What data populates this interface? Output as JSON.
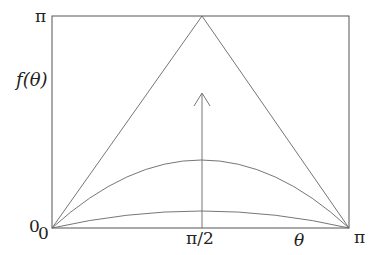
{
  "figure": {
    "y_label": "f(θ)",
    "x_label": "θ",
    "y_ticks": {
      "top": "π",
      "bottom": "0"
    },
    "x_ticks": {
      "left": "0",
      "middle": "π/2",
      "right": "π"
    },
    "curves": [
      {
        "name": "triangle",
        "peak": "π at θ=π/2"
      },
      {
        "name": "middle-arc",
        "peak_fraction": 0.32
      },
      {
        "name": "low-arc",
        "peak_fraction": 0.08
      }
    ],
    "arrow": "upward arrow at θ=π/2 indicating curves increasing toward the triangle"
  }
}
